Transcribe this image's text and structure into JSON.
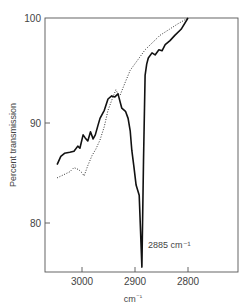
{
  "chart_data": {
    "type": "line",
    "title": "",
    "xlabel": "cm⁻¹",
    "ylabel": "Percent transmission",
    "xlim": [
      3070,
      2705
    ],
    "ylim": [
      75,
      100
    ],
    "x_reversed": true,
    "grid": false,
    "legend": null,
    "x_ticks": [
      3000,
      2900,
      2800
    ],
    "x_tick_labels": [
      "3000",
      "2900",
      "2800"
    ],
    "y_ticks": [
      80,
      90,
      100
    ],
    "y_tick_labels": [
      "80",
      "90",
      "100"
    ],
    "annotations": [
      {
        "text": "2885 cm⁻¹",
        "x": 2885,
        "y": 76.5
      }
    ],
    "series": [
      {
        "name": "solid",
        "style": "solid",
        "x": [
          3047,
          3040,
          3033,
          3023,
          3015,
          3008,
          3004,
          2998,
          2994,
          2989,
          2984,
          2979,
          2975,
          2970,
          2966,
          2958,
          2951,
          2944,
          2938,
          2932,
          2925,
          2918,
          2913,
          2909,
          2906,
          2902,
          2898,
          2892,
          2887,
          2884,
          2881,
          2878,
          2875,
          2868,
          2862,
          2855,
          2849,
          2843,
          2834,
          2825,
          2813,
          2800
        ],
        "y": [
          85.7,
          86.5,
          86.8,
          86.9,
          87.0,
          87.5,
          87.3,
          88.6,
          88.3,
          88.0,
          88.9,
          88.2,
          88.6,
          89.5,
          90.2,
          91.0,
          92.1,
          92.4,
          92.3,
          92.6,
          91.2,
          90.9,
          90.2,
          89.0,
          87.1,
          85.5,
          83.7,
          82.7,
          75.7,
          86.0,
          94.4,
          95.5,
          96.1,
          96.6,
          96.4,
          96.9,
          96.8,
          97.4,
          97.8,
          98.3,
          98.9,
          100.0
        ]
      },
      {
        "name": "dotted",
        "style": "dotted",
        "x": [
          3047,
          3035,
          3023,
          3015,
          3006,
          3000,
          2996,
          2989,
          2981,
          2974,
          2966,
          2958,
          2951,
          2943,
          2936,
          2932,
          2928,
          2918,
          2909,
          2895,
          2881,
          2867,
          2853,
          2835,
          2820,
          2800
        ],
        "y": [
          84.4,
          84.7,
          85.0,
          85.4,
          85.2,
          84.9,
          84.6,
          85.6,
          86.6,
          87.2,
          88.1,
          89.4,
          91.0,
          92.1,
          93.0,
          92.6,
          92.5,
          93.8,
          94.9,
          95.9,
          96.9,
          97.6,
          98.3,
          98.9,
          99.4,
          100.0
        ]
      }
    ]
  },
  "labels": {
    "ylabel": "Percent transmission",
    "xlabel_base": "cm",
    "xlabel_sup": "⁻¹",
    "annotation": "2885 cm⁻¹",
    "x_ticks": [
      "3000",
      "2900",
      "2800"
    ],
    "y_ticks": [
      "100",
      "90",
      "80"
    ]
  }
}
